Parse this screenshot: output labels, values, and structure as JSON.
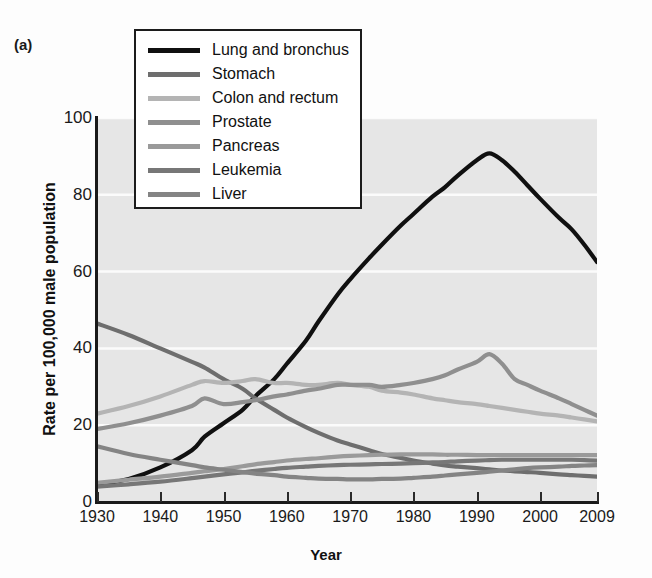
{
  "figure": {
    "panel_label": "(a)"
  },
  "chart_data": {
    "type": "line",
    "title": "",
    "xlabel": "Year",
    "ylabel": "Rate per 100,000 male population",
    "xlim": [
      1930,
      2009
    ],
    "ylim": [
      0,
      100
    ],
    "xticks": [
      1930,
      1940,
      1950,
      1960,
      1970,
      1980,
      1990,
      2000,
      2009
    ],
    "yticks": [
      0,
      20,
      40,
      60,
      80,
      100
    ],
    "grid": "horizontal-white",
    "legend_position": "top-center",
    "plot_background": "#e6e6e6",
    "x": [
      1930,
      1935,
      1940,
      1945,
      1947,
      1950,
      1953,
      1955,
      1958,
      1960,
      1963,
      1965,
      1968,
      1970,
      1973,
      1975,
      1978,
      1980,
      1983,
      1985,
      1987,
      1990,
      1992,
      1994,
      1996,
      1998,
      2000,
      2003,
      2005,
      2007,
      2009
    ],
    "series": [
      {
        "name": "Lung and bronchus",
        "color": "#101010",
        "width": 4.2,
        "values": [
          4.5,
          6.0,
          9.0,
          13.5,
          17.0,
          20.5,
          24.0,
          27.5,
          32.0,
          36.0,
          42.0,
          47.0,
          54.0,
          58.0,
          63.5,
          67.0,
          72.0,
          75.0,
          79.5,
          82.0,
          85.0,
          89.0,
          90.8,
          89.0,
          86.0,
          82.5,
          79.0,
          74.0,
          71.0,
          67.0,
          62.5
        ]
      },
      {
        "name": "Stomach",
        "color": "#6e6e6e",
        "width": 4.2,
        "values": [
          46.5,
          43.5,
          40.0,
          36.5,
          35.0,
          32.0,
          29.5,
          27.0,
          24.0,
          22.0,
          19.5,
          18.0,
          16.0,
          15.0,
          13.5,
          12.5,
          11.5,
          10.8,
          10.0,
          9.5,
          9.2,
          8.8,
          8.5,
          8.2,
          8.0,
          7.8,
          7.6,
          7.2,
          7.0,
          6.8,
          6.6
        ]
      },
      {
        "name": "Colon and rectum",
        "color": "#b4b4b4",
        "width": 4.2,
        "values": [
          23.0,
          25.0,
          27.5,
          30.5,
          31.5,
          31.0,
          31.5,
          32.0,
          31.0,
          31.0,
          30.5,
          30.5,
          31.0,
          30.5,
          30.0,
          29.0,
          28.5,
          28.0,
          27.0,
          26.5,
          26.0,
          25.5,
          25.0,
          24.5,
          24.0,
          23.5,
          23.0,
          22.5,
          22.0,
          21.5,
          21.0
        ]
      },
      {
        "name": "Prostate",
        "color": "#8f8f8f",
        "width": 4.2,
        "values": [
          19.0,
          20.5,
          22.5,
          25.0,
          27.0,
          25.5,
          26.0,
          26.5,
          27.5,
          28.0,
          29.0,
          29.5,
          30.5,
          30.5,
          30.5,
          30.0,
          30.5,
          31.0,
          32.0,
          33.0,
          34.5,
          36.5,
          38.5,
          36.0,
          32.0,
          30.5,
          29.0,
          27.0,
          25.5,
          24.0,
          22.5
        ]
      },
      {
        "name": "Pancreas",
        "color": "#9a9a9a",
        "width": 4.2,
        "values": [
          5.0,
          5.8,
          6.6,
          7.6,
          8.0,
          8.6,
          9.3,
          9.8,
          10.4,
          10.8,
          11.2,
          11.4,
          11.8,
          12.0,
          12.2,
          12.3,
          12.4,
          12.4,
          12.4,
          12.3,
          12.3,
          12.2,
          12.2,
          12.2,
          12.2,
          12.2,
          12.2,
          12.2,
          12.2,
          12.2,
          12.2
        ]
      },
      {
        "name": "Leukemia",
        "color": "#777777",
        "width": 4.2,
        "values": [
          4.0,
          4.6,
          5.3,
          6.2,
          6.6,
          7.2,
          7.7,
          8.1,
          8.6,
          8.9,
          9.2,
          9.4,
          9.6,
          9.7,
          9.8,
          9.9,
          10.0,
          10.1,
          10.3,
          10.4,
          10.6,
          10.8,
          10.9,
          11.0,
          11.0,
          11.0,
          11.0,
          11.0,
          11.0,
          10.9,
          10.8
        ]
      },
      {
        "name": "Liver",
        "color": "#848484",
        "width": 4.2,
        "values": [
          14.5,
          12.5,
          11.0,
          9.6,
          9.0,
          8.4,
          7.8,
          7.4,
          7.0,
          6.6,
          6.3,
          6.1,
          6.0,
          5.9,
          5.9,
          6.0,
          6.1,
          6.3,
          6.6,
          6.9,
          7.2,
          7.6,
          7.9,
          8.2,
          8.5,
          8.8,
          9.0,
          9.2,
          9.4,
          9.5,
          9.6
        ]
      }
    ]
  }
}
